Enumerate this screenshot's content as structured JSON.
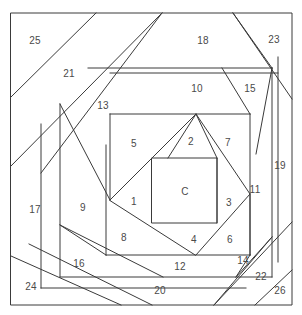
{
  "diagram": {
    "kind": "quilt-block-piecing-diagram",
    "title": "",
    "stroke_color": "#3a3a3a",
    "label_color": "#4a4a4a",
    "background_color": "#ffffff",
    "frame": {
      "x1": 11,
      "y1": 13,
      "x2": 292,
      "y2": 305
    },
    "center_label": "C",
    "center_square": {
      "x1": 152,
      "y1": 158,
      "x2": 217,
      "y2": 223
    },
    "pieces": [
      {
        "id": "center",
        "label": "C",
        "x": 185,
        "y": 192
      },
      {
        "id": "p1",
        "label": "1",
        "x": 134,
        "y": 202
      },
      {
        "id": "p2",
        "label": "2",
        "x": 191,
        "y": 142
      },
      {
        "id": "p3",
        "label": "3",
        "x": 229,
        "y": 203
      },
      {
        "id": "p4",
        "label": "4",
        "x": 194,
        "y": 240
      },
      {
        "id": "p5",
        "label": "5",
        "x": 134,
        "y": 144
      },
      {
        "id": "p6",
        "label": "6",
        "x": 230,
        "y": 240
      },
      {
        "id": "p7",
        "label": "7",
        "x": 228,
        "y": 143
      },
      {
        "id": "p8",
        "label": "8",
        "x": 124,
        "y": 238
      },
      {
        "id": "p9",
        "label": "9",
        "x": 83,
        "y": 208
      },
      {
        "id": "p10",
        "label": "10",
        "x": 197,
        "y": 89
      },
      {
        "id": "p11",
        "label": "11",
        "x": 255,
        "y": 190
      },
      {
        "id": "p12",
        "label": "12",
        "x": 180,
        "y": 267
      },
      {
        "id": "p13",
        "label": "13",
        "x": 103,
        "y": 106
      },
      {
        "id": "p14",
        "label": "14",
        "x": 243,
        "y": 261
      },
      {
        "id": "p15",
        "label": "15",
        "x": 250,
        "y": 89
      },
      {
        "id": "p16",
        "label": "16",
        "x": 79,
        "y": 264
      },
      {
        "id": "p17",
        "label": "17",
        "x": 35,
        "y": 210
      },
      {
        "id": "p18",
        "label": "18",
        "x": 203,
        "y": 41
      },
      {
        "id": "p19",
        "label": "19",
        "x": 280,
        "y": 166
      },
      {
        "id": "p20",
        "label": "20",
        "x": 160,
        "y": 291
      },
      {
        "id": "p21",
        "label": "21",
        "x": 69,
        "y": 74
      },
      {
        "id": "p22",
        "label": "22",
        "x": 261,
        "y": 277
      },
      {
        "id": "p23",
        "label": "23",
        "x": 274,
        "y": 40
      },
      {
        "id": "p24",
        "label": "24",
        "x": 31,
        "y": 287
      },
      {
        "id": "p25",
        "label": "25",
        "x": 35,
        "y": 41
      },
      {
        "id": "p26",
        "label": "26",
        "x": 280,
        "y": 291
      }
    ]
  }
}
